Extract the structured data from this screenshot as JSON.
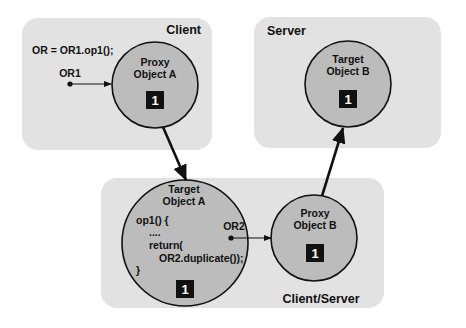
{
  "regions": {
    "client": {
      "label": "Client"
    },
    "server": {
      "label": "Server"
    },
    "client_server": {
      "label": "Client/Server"
    }
  },
  "client_code": "OR = OR1.op1();",
  "references": {
    "or1": "OR1",
    "or2": "OR2"
  },
  "objects": {
    "proxy_a": {
      "line1": "Proxy",
      "line2": "Object A",
      "badge": "1"
    },
    "target_b": {
      "line1": "Target",
      "line2": "Object B",
      "badge": "1"
    },
    "target_a": {
      "line1": "Target",
      "line2": "Object A",
      "badge": "1",
      "code": [
        "op1() {",
        "....",
        "return(",
        "OR2.duplicate());",
        "}"
      ]
    },
    "proxy_b": {
      "line1": "Proxy",
      "line2": "Object B",
      "badge": "1"
    }
  },
  "colors": {
    "region_fill": "#e2e2e2",
    "object_fill": "#bcbcbc",
    "stroke": "#111111"
  }
}
